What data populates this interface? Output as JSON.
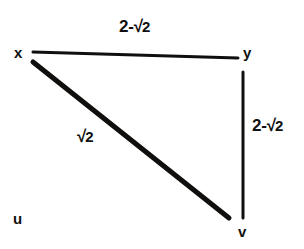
{
  "figure": {
    "type": "weighted-graph-diagram",
    "background_color": "#ffffff",
    "stroke_color": "#100f0d",
    "width": 304,
    "height": 249
  },
  "vertices": [
    {
      "id": "x",
      "label": "x",
      "x": 33,
      "y": 52
    },
    {
      "id": "y",
      "label": "y",
      "x": 243,
      "y": 58
    },
    {
      "id": "u",
      "label": "u",
      "x": 20,
      "y": 219
    },
    {
      "id": "v",
      "label": "v",
      "x": 243,
      "y": 218
    }
  ],
  "edges": [
    {
      "id": "xy",
      "from": "x",
      "to": "y",
      "label": "2-√2",
      "label_parts": {
        "prefix": "2-",
        "radical": "√",
        "radicand": "2"
      },
      "x1": 33,
      "y1": 52,
      "x2": 238,
      "y2": 58,
      "stroke_width": 3
    },
    {
      "id": "yv",
      "from": "y",
      "to": "v",
      "label": "2-√2",
      "label_parts": {
        "prefix": "2-",
        "radical": "√",
        "radicand": "2"
      },
      "x1": 243,
      "y1": 72,
      "x2": 243,
      "y2": 218,
      "stroke_width": 3
    },
    {
      "id": "xv",
      "from": "x",
      "to": "v",
      "label": "√2",
      "label_parts": {
        "prefix": "",
        "radical": "√",
        "radicand": "2"
      },
      "x1": 33,
      "y1": 62,
      "x2": 229,
      "y2": 218,
      "stroke_width": 5
    }
  ],
  "labels": {
    "vertex_x": "x",
    "vertex_y": "y",
    "vertex_u": "u",
    "vertex_v": "v",
    "edge_xy": "2-√2",
    "edge_yv": "2-√2",
    "edge_xv": "√2",
    "radical_sign": "√",
    "radicand_xy": "2",
    "prefix_xy": "2-",
    "radicand_yv": "2",
    "prefix_yv": "2-",
    "radicand_xv": "2"
  }
}
